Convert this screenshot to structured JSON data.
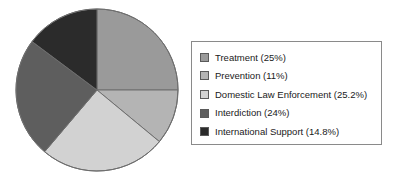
{
  "chart_data": {
    "type": "pie",
    "title": "",
    "categories": [
      "Treatment",
      "Prevention",
      "Domestic Law Enforcement",
      "Interdiction",
      "International Support"
    ],
    "values": [
      25,
      11,
      25.2,
      24,
      14.8
    ],
    "value_unit": "%",
    "colors": [
      "#9a9a9a",
      "#b4b4b4",
      "#d2d2d2",
      "#5e5e5e",
      "#2b2b2b"
    ],
    "start_angle_deg": 0,
    "direction": "clockwise",
    "legend_position": "right",
    "grid": false,
    "legend_entries": [
      {
        "label": "Treatment (25%)",
        "color": "#9a9a9a",
        "value": 25,
        "name": "Treatment"
      },
      {
        "label": "Prevention (11%)",
        "color": "#b4b4b4",
        "value": 11,
        "name": "Prevention"
      },
      {
        "label": "Domestic Law Enforcement (25.2%)",
        "color": "#d2d2d2",
        "value": 25.2,
        "name": "Domestic Law Enforcement"
      },
      {
        "label": "Interdiction (24%)",
        "color": "#5e5e5e",
        "value": 24,
        "name": "Interdiction"
      },
      {
        "label": "International Support (14.8%)",
        "color": "#2b2b2b",
        "value": 14.8,
        "name": "International Support"
      }
    ]
  },
  "pie": {
    "center_x": 82,
    "center_y": 82,
    "radius": 81,
    "outline_color": "#6e6e6e"
  },
  "legend": {
    "border_color": "#8a8a8a",
    "background": "#ffffff"
  }
}
